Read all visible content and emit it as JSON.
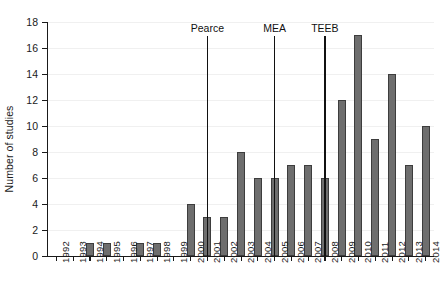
{
  "chart_data": {
    "type": "bar",
    "title": "",
    "xlabel": "",
    "ylabel": "Number of studies",
    "categories": [
      "1992",
      "1993",
      "1994",
      "1995",
      "1996",
      "1997",
      "1998",
      "1999",
      "2000",
      "2001",
      "2002",
      "2003",
      "2004",
      "2005",
      "2006",
      "2007",
      "2008",
      "2009",
      "2010",
      "2011",
      "2012",
      "2013",
      "2014"
    ],
    "values": [
      0,
      0,
      1,
      1,
      0,
      1,
      1,
      0,
      4,
      3,
      3,
      8,
      6,
      6,
      7,
      7,
      6,
      12,
      17,
      9,
      14,
      7,
      10
    ],
    "ylim": [
      0,
      18
    ],
    "ytick_values": [
      0,
      2,
      4,
      6,
      8,
      10,
      12,
      14,
      16,
      18
    ],
    "ytick_labels": [
      "0",
      "2",
      "4",
      "6",
      "8",
      "10",
      "12",
      "14",
      "16",
      "18"
    ],
    "grid": true,
    "grid_axis": "y",
    "legend": false,
    "legend_position": "none",
    "bar_color": "#6e6e6e",
    "bar_edge_color": "#3d3d3d",
    "grid_color": "#f0f0f0",
    "axis_color": "#1a1a1a",
    "annotations": [
      {
        "label": "Pearce",
        "at_category": "2001",
        "line_color": "#111111"
      },
      {
        "label": "MEA",
        "at_category": "2005",
        "line_color": "#111111"
      },
      {
        "label": "TEEB",
        "at_category": "2008",
        "line_color": "#111111"
      }
    ]
  }
}
